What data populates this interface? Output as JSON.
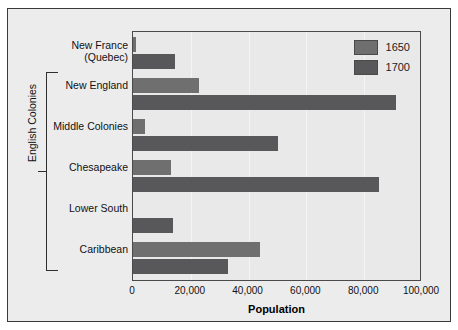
{
  "chart_data": {
    "type": "bar",
    "orientation": "horizontal",
    "title": "",
    "xlabel": "Population",
    "ylabel": "",
    "xlim": [
      0,
      100000
    ],
    "xticks": [
      0,
      20000,
      40000,
      60000,
      80000,
      100000
    ],
    "xtick_labels": [
      "0",
      "20,000",
      "40,000",
      "60,000",
      "80,000",
      "100,000"
    ],
    "grid": true,
    "grid_axis": "x",
    "legend_position": "top-right",
    "categories": [
      "New France (Quebec)",
      "New England",
      "Middle Colonies",
      "Chesapeake",
      "Lower South",
      "Caribbean"
    ],
    "category_lines": [
      [
        "New France",
        "(Quebec)"
      ],
      [
        "New England"
      ],
      [
        "Middle Colonies"
      ],
      [
        "Chesapeake"
      ],
      [
        "Lower South"
      ],
      [
        "Caribbean"
      ]
    ],
    "series": [
      {
        "name": "1650",
        "color": "#6f6f70",
        "values": [
          1000,
          23000,
          4000,
          13000,
          0,
          44000
        ]
      },
      {
        "name": "1700",
        "color": "#58585a",
        "values": [
          14500,
          91000,
          50000,
          85000,
          14000,
          33000
        ]
      }
    ],
    "annotations": [
      {
        "name": "english-colonies-bracket",
        "label": "English Colonies",
        "covers": [
          "New England",
          "Middle Colonies",
          "Chesapeake",
          "Lower South",
          "Caribbean"
        ]
      }
    ]
  },
  "legend": {
    "entries": [
      {
        "label": "1650",
        "color": "#6f6f70"
      },
      {
        "label": "1700",
        "color": "#58585a"
      }
    ]
  },
  "axis": {
    "x_title": "Population",
    "tick_0": "0",
    "tick_1": "20,000",
    "tick_2": "40,000",
    "tick_3": "60,000",
    "tick_4": "80,000",
    "tick_5": "100,000"
  },
  "labels": {
    "new_france_line1": "New France",
    "new_france_line2": "(Quebec)",
    "new_england": "New England",
    "middle_colonies": "Middle Colonies",
    "chesapeake": "Chesapeake",
    "lower_south": "Lower South",
    "caribbean": "Caribbean",
    "bracket": "English Colonies"
  },
  "colors": {
    "series_1650": "#6f6f70",
    "series_1700": "#58585a",
    "background": "#ececed",
    "plot_background": "#e9e9ea",
    "frame": "#3a3a3a"
  }
}
